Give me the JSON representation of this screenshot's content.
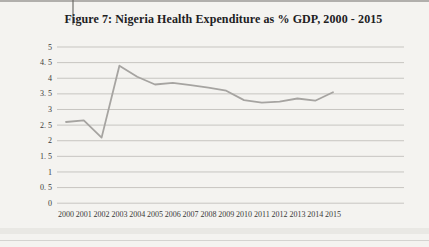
{
  "figure": {
    "title": "Figure 7: Nigeria Health Expenditure as % GDP, 2000 - 2015"
  },
  "colors": {
    "background": "#f4f3f0",
    "line": "#a6a4a1",
    "gridline": "#c7c5c1",
    "title_text": "#21201e",
    "tick_text": "#3b3a38"
  },
  "chart_data": {
    "type": "line",
    "title": "Figure 7: Nigeria Health Expenditure as % GDP, 2000 - 2015",
    "xlabel": "",
    "ylabel": "",
    "categories": [
      "2000",
      "2001",
      "2002",
      "2003",
      "2004",
      "2005",
      "2006",
      "2007",
      "2008",
      "2009",
      "2010",
      "2011",
      "2012",
      "2013",
      "2014",
      "2015"
    ],
    "series": [
      {
        "name": "Nigeria Health Expenditure as % GDP",
        "values": [
          2.6,
          2.65,
          2.1,
          4.4,
          4.05,
          3.8,
          3.85,
          3.78,
          3.7,
          3.6,
          3.3,
          3.22,
          3.25,
          3.35,
          3.28,
          3.55
        ]
      }
    ],
    "ylim": [
      0,
      5
    ],
    "ytick_step": 0.5,
    "ytick_labels": [
      "0",
      "0. 5",
      "1",
      "1. 5",
      "2",
      "2. 5",
      "3",
      "3. 5",
      "4",
      "4. 5",
      "5"
    ],
    "grid": true,
    "legend_position": "none"
  }
}
